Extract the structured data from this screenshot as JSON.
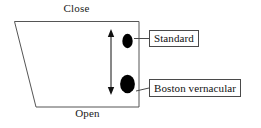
{
  "diagram": {
    "type": "vowel-space-trapezoid",
    "axis_labels": {
      "top": "Close",
      "bottom": "Open"
    },
    "callouts": [
      {
        "id": "standard",
        "label": "Standard"
      },
      {
        "id": "boston",
        "label": "Boston vernacular"
      }
    ],
    "arrow": {
      "name": "vertical-double-headed-arrow",
      "orientation": "vertical",
      "double_headed": true
    },
    "tokens": [
      {
        "id": "standard-token",
        "shape": "ellipse",
        "size": "small",
        "fill": "#000000"
      },
      {
        "id": "boston-token",
        "shape": "ellipse",
        "size": "large",
        "fill": "#000000"
      }
    ],
    "colors": {
      "outline": "#555555",
      "box_border": "#4a4a4a",
      "token_fill": "#000000",
      "text": "#111111",
      "background": "#ffffff"
    }
  }
}
